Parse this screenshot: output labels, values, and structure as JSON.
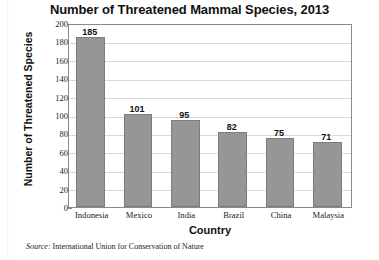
{
  "chart_data": {
    "type": "bar",
    "title": "Number of Threatened Mammal Species, 2013",
    "xlabel": "Country",
    "ylabel": "Number of Threatened Species",
    "categories": [
      "Indonesia",
      "Mexico",
      "India",
      "Brazil",
      "China",
      "Malaysia"
    ],
    "values": [
      185,
      101,
      95,
      82,
      75,
      71
    ],
    "ylim": [
      0,
      200
    ],
    "ytick_step": 20,
    "yticks": [
      200,
      180,
      160,
      140,
      120,
      100,
      80,
      60,
      40,
      20,
      0
    ],
    "grid": true,
    "legend": "none",
    "bar_color": "#969696",
    "bar_edge_color": "#7d7d7d",
    "gridline_color": "#d9d9d9",
    "axis_color": "#8a8a8a",
    "data_labels": [
      "185",
      "101",
      "95",
      "82",
      "75",
      "71"
    ]
  },
  "source": {
    "label": "Source:",
    "text": "International Union for Conservation of Nature"
  }
}
